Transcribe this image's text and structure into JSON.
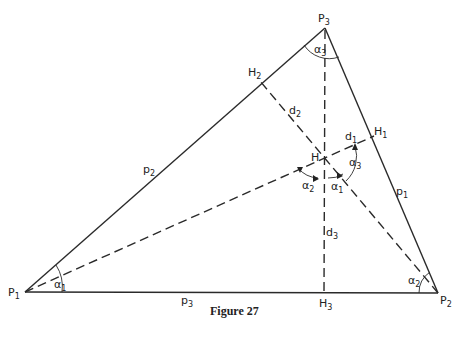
{
  "figure": {
    "caption": "Figure 27"
  },
  "vertices": [
    {
      "id": "P1",
      "base": "P",
      "sub": "1",
      "x": 25,
      "y": 292
    },
    {
      "id": "P2",
      "base": "P",
      "sub": "2",
      "x": 438,
      "y": 293
    },
    {
      "id": "P3",
      "base": "P",
      "sub": "3",
      "x": 325,
      "y": 28
    }
  ],
  "feet": [
    {
      "id": "H1",
      "base": "H",
      "sub": "1",
      "x": 374,
      "y": 136
    },
    {
      "id": "H2",
      "base": "H",
      "sub": "2",
      "x": 260,
      "y": 81
    },
    {
      "id": "H3",
      "base": "H",
      "sub": "3",
      "x": 324,
      "y": 293
    }
  ],
  "orthocenter": {
    "id": "H",
    "label": "H",
    "x": 323,
    "y": 157
  },
  "sides": [
    {
      "id": "p1",
      "base": "p",
      "sub": "1",
      "from": "P2",
      "to": "P3"
    },
    {
      "id": "p2",
      "base": "p",
      "sub": "2",
      "from": "P1",
      "to": "P3"
    },
    {
      "id": "p3",
      "base": "p",
      "sub": "3",
      "from": "P1",
      "to": "P2"
    }
  ],
  "distances": [
    {
      "id": "d1",
      "base": "d",
      "sub": "1"
    },
    {
      "id": "d2",
      "base": "d",
      "sub": "2"
    },
    {
      "id": "d3",
      "base": "d",
      "sub": "3"
    }
  ],
  "angles": [
    {
      "id": "alpha1_vertex",
      "base": "α",
      "sub": "1",
      "at": "P1"
    },
    {
      "id": "alpha2_vertex",
      "base": "α",
      "sub": "2",
      "at": "P2"
    },
    {
      "id": "alpha3_vertex",
      "base": "α",
      "sub": "3",
      "at": "P3"
    },
    {
      "id": "alpha1_H",
      "base": "α",
      "sub": "1",
      "at": "H"
    },
    {
      "id": "alpha2_H",
      "base": "α",
      "sub": "2",
      "at": "H"
    },
    {
      "id": "alpha3_H",
      "base": "α",
      "sub": "3",
      "at": "H"
    }
  ]
}
